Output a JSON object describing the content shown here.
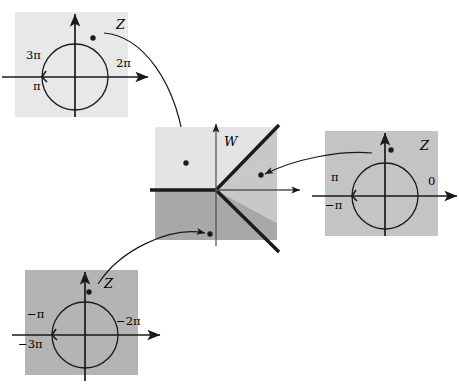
{
  "figure": {
    "background_color": "#ffffff",
    "line_color": "#1a1a1a"
  },
  "panels": [
    {
      "id": "top-left-z-sheet",
      "role": "source-sheet",
      "plane_label": "Z",
      "fill_color": "#e8e8e8",
      "rect": {
        "x": 15,
        "y": 12,
        "width": 113,
        "height": 105
      },
      "origin": {
        "x": 75,
        "y": 77
      },
      "circle_radius": 33,
      "arrow_direction": "counterclockwise",
      "point": {
        "x": 93,
        "y": 38
      },
      "axis_labels": [
        {
          "text": "3π",
          "position": "left-above"
        },
        {
          "text": "π",
          "position": "left-below"
        },
        {
          "text": "2π",
          "position": "right-above"
        }
      ]
    },
    {
      "id": "center-w-plane",
      "role": "target-plane",
      "plane_label": "W",
      "fill_color_upper": "#e4e4e4",
      "fill_color_right": "#c8c8c8",
      "fill_color_lower": "#a8a8a8",
      "rect": {
        "x": 155,
        "y": 127,
        "width": 122,
        "height": 113
      },
      "origin": {
        "x": 216,
        "y": 190
      },
      "points": [
        {
          "x": 186,
          "y": 163,
          "from": "top-left-z-sheet"
        },
        {
          "x": 261,
          "y": 175,
          "from": "right-z-sheet"
        },
        {
          "x": 210,
          "y": 234,
          "from": "bottom-left-z-sheet"
        }
      ]
    },
    {
      "id": "right-z-sheet",
      "role": "source-sheet",
      "plane_label": "Z",
      "fill_color": "#c4c4c4",
      "rect": {
        "x": 325,
        "y": 131,
        "width": 113,
        "height": 105
      },
      "origin": {
        "x": 385,
        "y": 196
      },
      "circle_radius": 33,
      "arrow_direction": "counterclockwise",
      "point": {
        "x": 391,
        "y": 150
      },
      "axis_labels": [
        {
          "text": "π",
          "position": "left-above"
        },
        {
          "text": "−π",
          "position": "left-below"
        },
        {
          "text": "0",
          "position": "right-above"
        }
      ]
    },
    {
      "id": "bottom-left-z-sheet",
      "role": "source-sheet",
      "plane_label": "Z",
      "fill_color": "#b4b4b4",
      "rect": {
        "x": 25,
        "y": 270,
        "width": 113,
        "height": 105
      },
      "origin": {
        "x": 85,
        "y": 335
      },
      "circle_radius": 33,
      "arrow_direction": "counterclockwise",
      "point": {
        "x": 89,
        "y": 292
      },
      "axis_labels": [
        {
          "text": "−π",
          "position": "left-above"
        },
        {
          "text": "−3π",
          "position": "left-below"
        },
        {
          "text": "−2π",
          "position": "right-above"
        }
      ]
    }
  ],
  "mapping_arrows": [
    {
      "id": "arrow-top-left-to-center",
      "from_panel": "top-left-z-sheet",
      "to_panel": "center-w-plane",
      "head_at": {
        "x": 186,
        "y": 160
      }
    },
    {
      "id": "arrow-right-to-center",
      "from_panel": "right-z-sheet",
      "to_panel": "center-w-plane",
      "head_at": {
        "x": 263,
        "y": 175
      }
    },
    {
      "id": "arrow-bottom-left-to-center",
      "from_panel": "bottom-left-z-sheet",
      "to_panel": "center-w-plane",
      "head_at": {
        "x": 207,
        "y": 234
      }
    }
  ],
  "labels": {
    "top_left": {
      "plane": "Z",
      "left_above": "3π",
      "left_below": "π",
      "right_above": "2π"
    },
    "center": {
      "plane": "W"
    },
    "right": {
      "plane": "Z",
      "left_above": "π",
      "left_below": "−π",
      "right_above": "0"
    },
    "bottom_left": {
      "plane": "Z",
      "left_above": "−π",
      "left_below": "−3π",
      "right_above": "−2π"
    }
  }
}
